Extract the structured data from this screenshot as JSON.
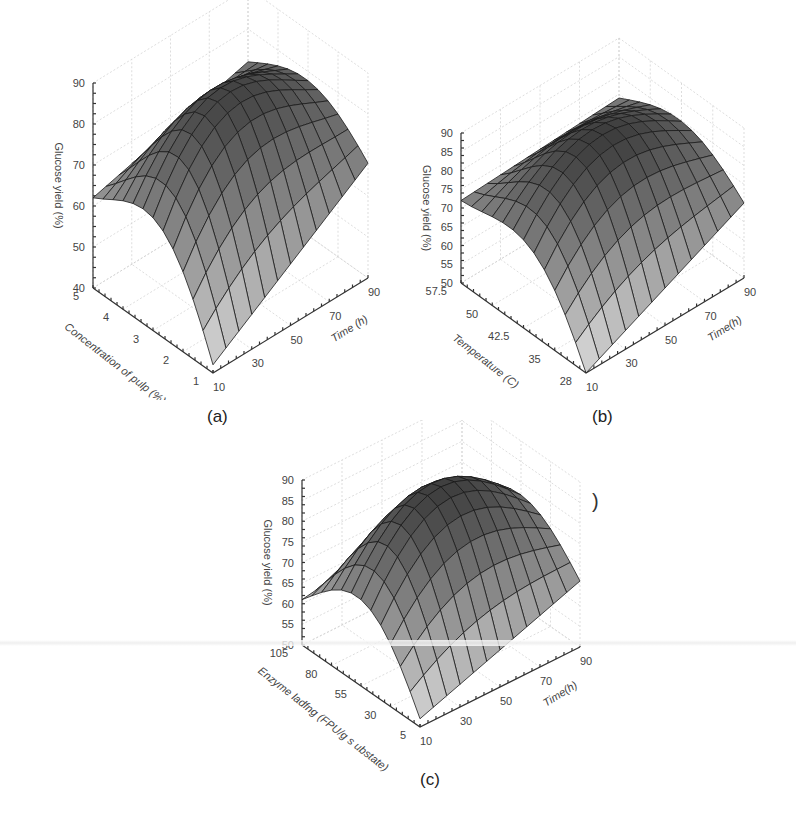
{
  "figure": {
    "labels": [
      "(a)",
      "(b)",
      "(c)"
    ],
    "stray_glyph": ")"
  },
  "chart_data": [
    {
      "type": "surface3d",
      "panel": "(a)",
      "zlabel": "Glucose yield (%)",
      "xlabel": "Time (h)",
      "ylabel": "Concentration of pulp (%)",
      "z_ticks": [
        "40",
        "50",
        "60",
        "70",
        "80",
        "90"
      ],
      "x_ticks": [
        "10",
        "30",
        "50",
        "70",
        "90"
      ],
      "y_ticks": [
        "1",
        "2",
        "3",
        "4",
        "5"
      ],
      "zlim": [
        40,
        90
      ],
      "xlim": [
        10,
        90
      ],
      "ylim": [
        1,
        5
      ],
      "grid": true,
      "description": "Dome-shaped response surface; max ~88% near mid pulp concentration and longer time; minimum ~40% at low time & low concentration corner",
      "corners": {
        "t10_c1": 42,
        "t10_c5": 62,
        "t90_c1": 68,
        "t90_c5": 72
      },
      "peak": {
        "time": 70,
        "conc": 3,
        "yield": 88
      }
    },
    {
      "type": "surface3d",
      "panel": "(b)",
      "zlabel": "Glucose yield (%)",
      "xlabel": "Time(h)",
      "ylabel": "Temperature (C)",
      "z_ticks": [
        "50",
        "55",
        "60",
        "65",
        "70",
        "75",
        "80",
        "85",
        "90"
      ],
      "x_ticks": [
        "10",
        "30",
        "50",
        "70",
        "90"
      ],
      "y_ticks": [
        "28",
        "35",
        "42.5",
        "50",
        "57.5"
      ],
      "zlim": [
        50,
        90
      ],
      "xlim": [
        10,
        90
      ],
      "ylim": [
        28,
        57.5
      ],
      "grid": true,
      "description": "Dome-shaped response surface; max ~90% near 42.5 C and 60-70 h; minimum ~50% at 10 h & 28 C",
      "corners": {
        "t10_T28": 50,
        "t10_T57.5": 72,
        "t90_T28": 70,
        "t90_T57.5": 74
      },
      "peak": {
        "time": 65,
        "temp": 45,
        "yield": 90
      }
    },
    {
      "type": "surface3d",
      "panel": "(c)",
      "zlabel": "Glucose yield (%)",
      "xlabel": "Time(h)",
      "ylabel": "Enzyme loading (FPU/g substrate)",
      "ylabel_as_printed": "Enzyme ladfng (FPU/g s ubstate)",
      "z_ticks": [
        "50",
        "55",
        "60",
        "65",
        "70",
        "75",
        "80",
        "85",
        "90"
      ],
      "x_ticks": [
        "10",
        "30",
        "50",
        "70",
        "90"
      ],
      "y_ticks": [
        "5",
        "30",
        "55",
        "80",
        "105"
      ],
      "zlim": [
        50,
        90
      ],
      "xlim": [
        10,
        90
      ],
      "ylim": [
        5,
        105
      ],
      "grid": true,
      "description": "Dome-shaped response surface; max ~90% near mid enzyme loading and 60-70 h; minimum ~52% at 10 h & 5 FPU/g",
      "corners": {
        "t10_E5": 52,
        "t10_E105": 61,
        "t90_E5": 66,
        "t90_E105": 68
      },
      "peak": {
        "time": 65,
        "enzyme": 60,
        "yield": 90
      }
    }
  ]
}
